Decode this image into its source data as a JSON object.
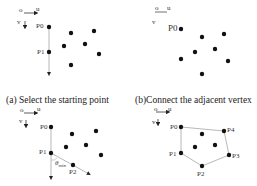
{
  "captions": {
    "a": "(a) Select the starting point",
    "b": "(b)Connect the adjacent vertex"
  },
  "axis_labels": {
    "origin": "o",
    "u": "u",
    "v": "v"
  },
  "points": {
    "p0": "P0",
    "p1": "P1",
    "p2": "P2",
    "p3": "P3",
    "p4": "P4"
  },
  "theta_label": "θ",
  "theta_sub": "min",
  "colors": {
    "dot": "#111111",
    "line": "#888888",
    "text": "#222222"
  }
}
